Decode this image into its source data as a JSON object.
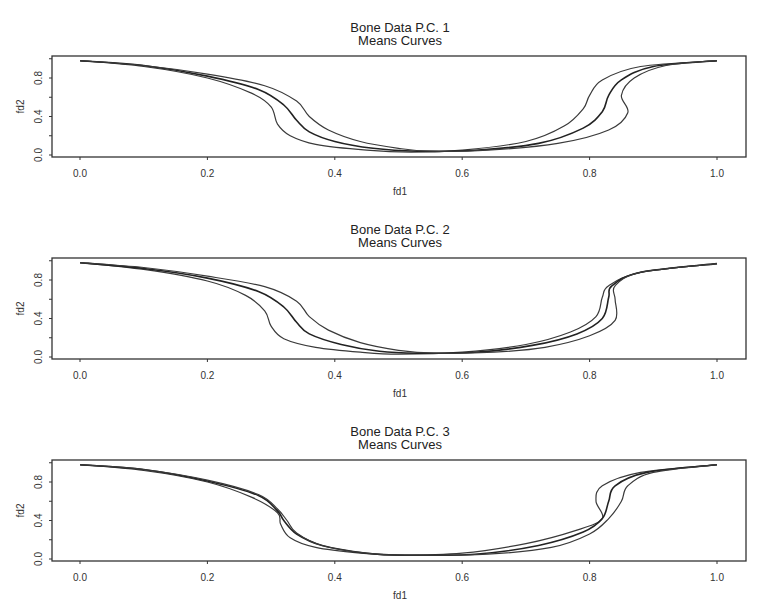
{
  "panels": [
    {
      "title": "Bone Data P.C.  1",
      "subtitle": "Means Curves",
      "xlabel": "fd1",
      "ylabel": "fd2"
    },
    {
      "title": "Bone Data P.C.  2",
      "subtitle": "Means Curves",
      "xlabel": "fd1",
      "ylabel": "fd2"
    },
    {
      "title": "Bone Data P.C.  3",
      "subtitle": "Means Curves",
      "xlabel": "fd1",
      "ylabel": "fd2"
    }
  ],
  "chart_data": [
    {
      "type": "line",
      "title": "Bone Data P.C.  1",
      "subtitle": "Means Curves",
      "xlabel": "fd1",
      "ylabel": "fd2",
      "xlim": [
        -0.04,
        1.05
      ],
      "ylim": [
        0.0,
        1.05
      ],
      "xticks": [
        0.0,
        0.2,
        0.4,
        0.6,
        0.8,
        1.0
      ],
      "xtick_labels": [
        "0.0",
        "0.2",
        "0.4",
        "0.6",
        "0.8",
        "1.0"
      ],
      "yticks": [
        0.0,
        0.4,
        0.8
      ],
      "ytick_labels": [
        "0.0",
        "0.4",
        "0.8"
      ],
      "grid": false,
      "legend": null,
      "series": [
        {
          "name": "mean - PC",
          "points": [
            [
              0.0,
              0.98
            ],
            [
              0.1,
              0.92
            ],
            [
              0.2,
              0.8
            ],
            [
              0.27,
              0.64
            ],
            [
              0.3,
              0.5
            ],
            [
              0.31,
              0.32
            ],
            [
              0.33,
              0.2
            ],
            [
              0.37,
              0.11
            ],
            [
              0.45,
              0.05
            ],
            [
              0.52,
              0.03
            ],
            [
              0.6,
              0.05
            ],
            [
              0.7,
              0.14
            ],
            [
              0.76,
              0.3
            ],
            [
              0.79,
              0.48
            ],
            [
              0.8,
              0.62
            ],
            [
              0.82,
              0.78
            ],
            [
              0.88,
              0.92
            ],
            [
              1.0,
              0.98
            ]
          ]
        },
        {
          "name": "mean",
          "points": [
            [
              0.0,
              0.98
            ],
            [
              0.1,
              0.93
            ],
            [
              0.2,
              0.82
            ],
            [
              0.28,
              0.68
            ],
            [
              0.32,
              0.52
            ],
            [
              0.34,
              0.36
            ],
            [
              0.36,
              0.24
            ],
            [
              0.4,
              0.14
            ],
            [
              0.46,
              0.07
            ],
            [
              0.53,
              0.04
            ],
            [
              0.62,
              0.05
            ],
            [
              0.72,
              0.12
            ],
            [
              0.79,
              0.28
            ],
            [
              0.82,
              0.45
            ],
            [
              0.83,
              0.62
            ],
            [
              0.85,
              0.78
            ],
            [
              0.9,
              0.92
            ],
            [
              1.0,
              0.98
            ]
          ]
        },
        {
          "name": "mean + PC",
          "points": [
            [
              0.0,
              0.98
            ],
            [
              0.1,
              0.93
            ],
            [
              0.2,
              0.84
            ],
            [
              0.29,
              0.72
            ],
            [
              0.34,
              0.56
            ],
            [
              0.36,
              0.4
            ],
            [
              0.39,
              0.26
            ],
            [
              0.44,
              0.14
            ],
            [
              0.5,
              0.07
            ],
            [
              0.55,
              0.04
            ],
            [
              0.64,
              0.05
            ],
            [
              0.75,
              0.12
            ],
            [
              0.83,
              0.26
            ],
            [
              0.86,
              0.44
            ],
            [
              0.85,
              0.62
            ],
            [
              0.87,
              0.8
            ],
            [
              0.92,
              0.93
            ],
            [
              1.0,
              0.98
            ]
          ]
        }
      ]
    },
    {
      "type": "line",
      "title": "Bone Data P.C.  2",
      "subtitle": "Means Curves",
      "xlabel": "fd1",
      "ylabel": "fd2",
      "xlim": [
        -0.04,
        1.05
      ],
      "ylim": [
        0.0,
        1.05
      ],
      "xticks": [
        0.0,
        0.2,
        0.4,
        0.6,
        0.8,
        1.0
      ],
      "xtick_labels": [
        "0.0",
        "0.2",
        "0.4",
        "0.6",
        "0.8",
        "1.0"
      ],
      "yticks": [
        0.0,
        0.4,
        0.8
      ],
      "ytick_labels": [
        "0.0",
        "0.4",
        "0.8"
      ],
      "grid": false,
      "legend": null,
      "series": [
        {
          "name": "mean - PC",
          "points": [
            [
              0.0,
              0.98
            ],
            [
              0.1,
              0.91
            ],
            [
              0.2,
              0.79
            ],
            [
              0.26,
              0.64
            ],
            [
              0.29,
              0.48
            ],
            [
              0.3,
              0.32
            ],
            [
              0.32,
              0.19
            ],
            [
              0.37,
              0.1
            ],
            [
              0.44,
              0.05
            ],
            [
              0.5,
              0.03
            ],
            [
              0.6,
              0.05
            ],
            [
              0.7,
              0.13
            ],
            [
              0.77,
              0.26
            ],
            [
              0.81,
              0.42
            ],
            [
              0.82,
              0.62
            ],
            [
              0.83,
              0.74
            ],
            [
              0.88,
              0.88
            ],
            [
              1.0,
              0.97
            ]
          ]
        },
        {
          "name": "mean",
          "points": [
            [
              0.0,
              0.98
            ],
            [
              0.1,
              0.92
            ],
            [
              0.2,
              0.82
            ],
            [
              0.28,
              0.68
            ],
            [
              0.32,
              0.52
            ],
            [
              0.34,
              0.36
            ],
            [
              0.36,
              0.24
            ],
            [
              0.41,
              0.13
            ],
            [
              0.47,
              0.06
            ],
            [
              0.53,
              0.04
            ],
            [
              0.62,
              0.05
            ],
            [
              0.71,
              0.12
            ],
            [
              0.78,
              0.24
            ],
            [
              0.82,
              0.4
            ],
            [
              0.83,
              0.62
            ],
            [
              0.835,
              0.74
            ],
            [
              0.88,
              0.88
            ],
            [
              1.0,
              0.97
            ]
          ]
        },
        {
          "name": "mean + PC",
          "points": [
            [
              0.0,
              0.98
            ],
            [
              0.1,
              0.93
            ],
            [
              0.2,
              0.84
            ],
            [
              0.29,
              0.73
            ],
            [
              0.34,
              0.58
            ],
            [
              0.36,
              0.42
            ],
            [
              0.39,
              0.28
            ],
            [
              0.44,
              0.15
            ],
            [
              0.5,
              0.07
            ],
            [
              0.56,
              0.04
            ],
            [
              0.65,
              0.05
            ],
            [
              0.73,
              0.1
            ],
            [
              0.8,
              0.22
            ],
            [
              0.84,
              0.38
            ],
            [
              0.84,
              0.6
            ],
            [
              0.84,
              0.74
            ],
            [
              0.88,
              0.88
            ],
            [
              1.0,
              0.97
            ]
          ]
        }
      ]
    },
    {
      "type": "line",
      "title": "Bone Data P.C.  3",
      "subtitle": "Means Curves",
      "xlabel": "fd1",
      "ylabel": "fd2",
      "xlim": [
        -0.04,
        1.05
      ],
      "ylim": [
        0.0,
        1.05
      ],
      "xticks": [
        0.0,
        0.2,
        0.4,
        0.6,
        0.8,
        1.0
      ],
      "xtick_labels": [
        "0.0",
        "0.2",
        "0.4",
        "0.6",
        "0.8",
        "1.0"
      ],
      "yticks": [
        0.0,
        0.4,
        0.8
      ],
      "ytick_labels": [
        "0.0",
        "0.4",
        "0.8"
      ],
      "grid": false,
      "legend": null,
      "series": [
        {
          "name": "mean - PC",
          "points": [
            [
              0.0,
              0.98
            ],
            [
              0.1,
              0.92
            ],
            [
              0.2,
              0.8
            ],
            [
              0.27,
              0.64
            ],
            [
              0.31,
              0.48
            ],
            [
              0.315,
              0.36
            ],
            [
              0.33,
              0.22
            ],
            [
              0.37,
              0.12
            ],
            [
              0.44,
              0.06
            ],
            [
              0.5,
              0.04
            ],
            [
              0.6,
              0.06
            ],
            [
              0.7,
              0.16
            ],
            [
              0.78,
              0.3
            ],
            [
              0.82,
              0.42
            ],
            [
              0.81,
              0.6
            ],
            [
              0.82,
              0.76
            ],
            [
              0.88,
              0.9
            ],
            [
              1.0,
              0.98
            ]
          ]
        },
        {
          "name": "mean",
          "points": [
            [
              0.0,
              0.98
            ],
            [
              0.1,
              0.93
            ],
            [
              0.2,
              0.81
            ],
            [
              0.28,
              0.66
            ],
            [
              0.31,
              0.5
            ],
            [
              0.32,
              0.4
            ],
            [
              0.34,
              0.26
            ],
            [
              0.38,
              0.14
            ],
            [
              0.45,
              0.06
            ],
            [
              0.51,
              0.04
            ],
            [
              0.62,
              0.05
            ],
            [
              0.72,
              0.14
            ],
            [
              0.79,
              0.28
            ],
            [
              0.82,
              0.42
            ],
            [
              0.83,
              0.6
            ],
            [
              0.84,
              0.76
            ],
            [
              0.89,
              0.9
            ],
            [
              1.0,
              0.98
            ]
          ]
        },
        {
          "name": "mean + PC",
          "points": [
            [
              0.0,
              0.98
            ],
            [
              0.1,
              0.93
            ],
            [
              0.2,
              0.82
            ],
            [
              0.28,
              0.67
            ],
            [
              0.31,
              0.52
            ],
            [
              0.325,
              0.4
            ],
            [
              0.34,
              0.27
            ],
            [
              0.38,
              0.14
            ],
            [
              0.45,
              0.06
            ],
            [
              0.51,
              0.04
            ],
            [
              0.64,
              0.05
            ],
            [
              0.74,
              0.12
            ],
            [
              0.8,
              0.26
            ],
            [
              0.83,
              0.42
            ],
            [
              0.85,
              0.6
            ],
            [
              0.86,
              0.76
            ],
            [
              0.9,
              0.9
            ],
            [
              1.0,
              0.98
            ]
          ]
        }
      ]
    }
  ]
}
